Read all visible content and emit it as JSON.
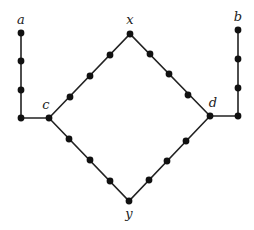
{
  "diagram": {
    "type": "graph",
    "colors": {
      "edge": "#222222",
      "node": "#111111",
      "label": "#222222",
      "background": "#ffffff"
    },
    "labels": [
      {
        "id": "a",
        "text": "a",
        "x": 21,
        "y": 24
      },
      {
        "id": "b",
        "text": "b",
        "x": 238,
        "y": 21
      },
      {
        "id": "c",
        "text": "c",
        "x": 46,
        "y": 109
      },
      {
        "id": "d",
        "text": "d",
        "x": 213,
        "y": 107
      },
      {
        "id": "x",
        "text": "x",
        "x": 130,
        "y": 24
      },
      {
        "id": "y",
        "text": "y",
        "x": 129,
        "y": 218
      }
    ],
    "nodes": [
      {
        "id": "a",
        "x": 21,
        "y": 33
      },
      {
        "id": "a1",
        "x": 21,
        "y": 61
      },
      {
        "id": "a2",
        "x": 21,
        "y": 90
      },
      {
        "id": "a3",
        "x": 21,
        "y": 118
      },
      {
        "id": "c",
        "x": 49,
        "y": 118
      },
      {
        "id": "cx1",
        "x": 70,
        "y": 97
      },
      {
        "id": "cx2",
        "x": 90,
        "y": 76
      },
      {
        "id": "cx3",
        "x": 110,
        "y": 55
      },
      {
        "id": "x",
        "x": 130,
        "y": 34
      },
      {
        "id": "xd1",
        "x": 150,
        "y": 54
      },
      {
        "id": "xd2",
        "x": 169,
        "y": 74
      },
      {
        "id": "xd3",
        "x": 188,
        "y": 95
      },
      {
        "id": "d",
        "x": 210,
        "y": 116
      },
      {
        "id": "cy1",
        "x": 69,
        "y": 139
      },
      {
        "id": "cy2",
        "x": 90,
        "y": 160
      },
      {
        "id": "cy3",
        "x": 110,
        "y": 181
      },
      {
        "id": "y",
        "x": 129,
        "y": 201
      },
      {
        "id": "yd1",
        "x": 149,
        "y": 180
      },
      {
        "id": "yd2",
        "x": 167,
        "y": 161
      },
      {
        "id": "yd3",
        "x": 186,
        "y": 141
      },
      {
        "id": "b3",
        "x": 238,
        "y": 116
      },
      {
        "id": "b2",
        "x": 238,
        "y": 88
      },
      {
        "id": "b1",
        "x": 238,
        "y": 59
      },
      {
        "id": "b",
        "x": 238,
        "y": 30
      }
    ],
    "paths": [
      {
        "id": "a-c",
        "points": "21,33 21,118 49,118"
      },
      {
        "id": "c-x-d",
        "points": "49,118 130,34 210,116"
      },
      {
        "id": "c-y-d",
        "points": "49,118 129,201 210,116"
      },
      {
        "id": "d-b",
        "points": "210,116 238,116 238,30"
      }
    ]
  }
}
